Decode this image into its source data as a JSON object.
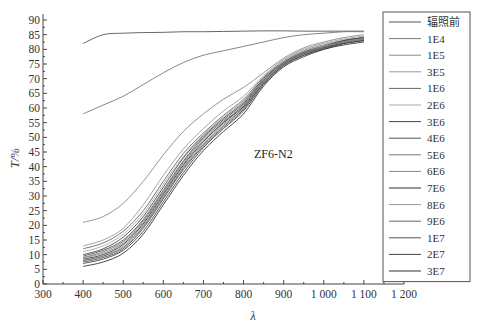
{
  "chart_data": {
    "type": "line",
    "title": "",
    "annotation": "ZF6-N2",
    "xlabel": "λ",
    "ylabel": "T/%",
    "xlim": [
      300,
      1200
    ],
    "ylim": [
      0,
      90
    ],
    "xticks": [
      300,
      400,
      500,
      600,
      700,
      800,
      900,
      1000,
      1100,
      1200
    ],
    "xtick_labels": [
      "300",
      "400",
      "500",
      "600",
      "700",
      "800",
      "900",
      "1 000",
      "1 100",
      "1 200"
    ],
    "yticks": [
      0,
      5,
      10,
      15,
      20,
      25,
      30,
      35,
      40,
      45,
      50,
      55,
      60,
      65,
      70,
      75,
      80,
      85,
      90
    ],
    "grid": false,
    "legend_position": "right-outside-box",
    "x": [
      400,
      450,
      500,
      550,
      600,
      650,
      700,
      750,
      800,
      850,
      900,
      950,
      1000,
      1050,
      1100
    ],
    "series": [
      {
        "name": "辐照前",
        "color": "#555555",
        "values": [
          82,
          85,
          85.5,
          85.7,
          85.8,
          86,
          86,
          86.1,
          86.2,
          86.3,
          86.3,
          86.2,
          86.2,
          86.2,
          86.2
        ]
      },
      {
        "name": "1E4",
        "color": "#777777",
        "values": [
          58,
          61,
          64,
          68,
          72,
          75.5,
          78,
          79.5,
          81,
          82.5,
          84,
          85,
          85.5,
          86,
          86
        ]
      },
      {
        "name": "1E5",
        "color": "#888888",
        "values": [
          21,
          23,
          27.5,
          35,
          44,
          52,
          58,
          63,
          67,
          72,
          77,
          80.5,
          82.5,
          84,
          85
        ]
      },
      {
        "name": "3E5",
        "color": "#999999",
        "values": [
          13,
          15,
          19,
          27,
          37,
          46,
          53,
          59,
          64,
          71,
          76.5,
          80,
          82,
          83.5,
          84.5
        ]
      },
      {
        "name": "1E6",
        "color": "#666666",
        "values": [
          12,
          14,
          18,
          25,
          35,
          44.5,
          51.5,
          57.5,
          63,
          70.5,
          76,
          79.5,
          81.5,
          83,
          84
        ]
      },
      {
        "name": "2E6",
        "color": "#aaaaaa",
        "values": [
          11,
          13,
          17,
          24,
          34,
          43.5,
          51,
          57,
          62.5,
          70,
          76,
          79.5,
          81.5,
          83,
          84
        ]
      },
      {
        "name": "3E6",
        "color": "#444444",
        "values": [
          10,
          12,
          16,
          23,
          33,
          43,
          50.5,
          56.5,
          62,
          70,
          75.5,
          79,
          81,
          83,
          84
        ]
      },
      {
        "name": "4E6",
        "color": "#555555",
        "values": [
          9.5,
          11.5,
          15,
          22,
          32,
          42,
          50,
          56,
          61.5,
          69.5,
          75.5,
          79,
          81,
          83,
          84
        ]
      },
      {
        "name": "5E6",
        "color": "#777777",
        "values": [
          9,
          11,
          14.5,
          21.5,
          31.5,
          41.5,
          49.5,
          55.5,
          61,
          69.5,
          75.5,
          79,
          81,
          82.5,
          83.5
        ]
      },
      {
        "name": "6E6",
        "color": "#888888",
        "values": [
          9,
          10.5,
          14,
          21,
          31,
          41,
          49,
          55,
          61,
          69,
          75,
          78.5,
          81,
          82.5,
          83.5
        ]
      },
      {
        "name": "7E6",
        "color": "#333333",
        "values": [
          8.5,
          10,
          13.5,
          20.5,
          30.5,
          40.5,
          48.5,
          55,
          60.5,
          69,
          75,
          78.5,
          80.5,
          82.5,
          83.5
        ]
      },
      {
        "name": "8E6",
        "color": "#999999",
        "values": [
          8,
          9.5,
          13,
          20,
          30,
          40,
          48,
          54.5,
          60,
          69,
          75,
          78.5,
          80.5,
          82.5,
          83.5
        ]
      },
      {
        "name": "9E6",
        "color": "#666666",
        "values": [
          8,
          9.5,
          12.5,
          19.5,
          29.5,
          39.5,
          47.5,
          54,
          60,
          68.5,
          75,
          78.5,
          80.5,
          82,
          83
        ]
      },
      {
        "name": "1E7",
        "color": "#555555",
        "values": [
          7.5,
          9,
          12,
          19,
          29,
          39,
          47,
          53.5,
          59.5,
          68.5,
          74.5,
          78,
          80.5,
          82,
          83
        ]
      },
      {
        "name": "2E7",
        "color": "#444444",
        "values": [
          7,
          8.5,
          11.5,
          18,
          28,
          38,
          46.5,
          53,
          59,
          68,
          74.5,
          78,
          80,
          82,
          83
        ]
      },
      {
        "name": "3E7",
        "color": "#333333",
        "values": [
          6,
          7.5,
          10.5,
          17,
          27,
          37,
          45.5,
          52,
          58,
          67.5,
          74,
          77.5,
          80,
          81.5,
          82.5
        ]
      }
    ]
  },
  "axes": {
    "ylabel": "T/%",
    "xlabel": "λ"
  }
}
